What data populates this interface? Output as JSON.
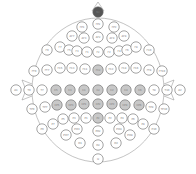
{
  "diagram": {
    "colors": {
      "highlight": "#c8c8c8",
      "reference": "#555555",
      "default": "#ffffff"
    },
    "electrodes": [
      {
        "label": "Nz",
        "x": 98,
        "y": 12,
        "type": "dark"
      },
      {
        "label": "FPz",
        "x": 98,
        "y": 24,
        "type": "normal"
      },
      {
        "label": "FP1",
        "x": 82,
        "y": 27,
        "type": "normal"
      },
      {
        "label": "FP2",
        "x": 114,
        "y": 27,
        "type": "normal"
      },
      {
        "label": "AF7",
        "x": 72,
        "y": 36,
        "type": "normal"
      },
      {
        "label": "AF3",
        "x": 84,
        "y": 38,
        "type": "normal"
      },
      {
        "label": "AFz",
        "x": 98,
        "y": 37,
        "type": "normal"
      },
      {
        "label": "AF4",
        "x": 112,
        "y": 38,
        "type": "normal"
      },
      {
        "label": "AF8",
        "x": 124,
        "y": 36,
        "type": "normal"
      },
      {
        "label": "F9",
        "x": 47,
        "y": 50,
        "type": "normal"
      },
      {
        "label": "F7",
        "x": 60,
        "y": 47,
        "type": "normal"
      },
      {
        "label": "F5",
        "x": 69,
        "y": 50,
        "type": "normal"
      },
      {
        "label": "F3",
        "x": 77,
        "y": 51,
        "type": "normal"
      },
      {
        "label": "F1",
        "x": 87,
        "y": 52,
        "type": "normal"
      },
      {
        "label": "Fz",
        "x": 98,
        "y": 52,
        "type": "normal"
      },
      {
        "label": "F2",
        "x": 109,
        "y": 52,
        "type": "normal"
      },
      {
        "label": "F4",
        "x": 119,
        "y": 51,
        "type": "normal"
      },
      {
        "label": "F6",
        "x": 127,
        "y": 50,
        "type": "normal"
      },
      {
        "label": "F8",
        "x": 136,
        "y": 47,
        "type": "normal"
      },
      {
        "label": "F10",
        "x": 149,
        "y": 50,
        "type": "normal"
      },
      {
        "label": "FT9",
        "x": 34,
        "y": 71,
        "type": "normal"
      },
      {
        "label": "FT7",
        "x": 47,
        "y": 70,
        "type": "normal"
      },
      {
        "label": "FC5",
        "x": 60,
        "y": 68,
        "type": "normal"
      },
      {
        "label": "FC3",
        "x": 72,
        "y": 68,
        "type": "normal"
      },
      {
        "label": "FC1",
        "x": 85,
        "y": 69,
        "type": "normal"
      },
      {
        "label": "FCz",
        "x": 98,
        "y": 70,
        "type": "gray"
      },
      {
        "label": "FC2",
        "x": 111,
        "y": 69,
        "type": "normal"
      },
      {
        "label": "FC4",
        "x": 124,
        "y": 68,
        "type": "normal"
      },
      {
        "label": "FC6",
        "x": 136,
        "y": 68,
        "type": "normal"
      },
      {
        "label": "FT8",
        "x": 149,
        "y": 70,
        "type": "normal"
      },
      {
        "label": "FT10",
        "x": 162,
        "y": 71,
        "type": "normal"
      },
      {
        "label": "A1",
        "x": 16,
        "y": 90,
        "type": "normal"
      },
      {
        "label": "T9",
        "x": 29,
        "y": 90,
        "type": "normal"
      },
      {
        "label": "T7",
        "x": 42,
        "y": 90,
        "type": "normal"
      },
      {
        "label": "C5",
        "x": 56,
        "y": 90,
        "type": "gray"
      },
      {
        "label": "C3",
        "x": 70,
        "y": 90,
        "type": "gray"
      },
      {
        "label": "C1",
        "x": 84,
        "y": 90,
        "type": "gray"
      },
      {
        "label": "Cz",
        "x": 98,
        "y": 90,
        "type": "gray"
      },
      {
        "label": "C2",
        "x": 112,
        "y": 90,
        "type": "gray"
      },
      {
        "label": "C4",
        "x": 126,
        "y": 90,
        "type": "gray"
      },
      {
        "label": "C6",
        "x": 140,
        "y": 90,
        "type": "gray"
      },
      {
        "label": "T8",
        "x": 154,
        "y": 90,
        "type": "normal"
      },
      {
        "label": "T10",
        "x": 167,
        "y": 90,
        "type": "normal"
      },
      {
        "label": "A2",
        "x": 180,
        "y": 90,
        "type": "normal"
      },
      {
        "label": "TP9",
        "x": 32,
        "y": 109,
        "type": "normal"
      },
      {
        "label": "TP7",
        "x": 45,
        "y": 107,
        "type": "normal"
      },
      {
        "label": "CP5",
        "x": 57,
        "y": 105,
        "type": "gray"
      },
      {
        "label": "CP3",
        "x": 71,
        "y": 105,
        "type": "gray"
      },
      {
        "label": "CP1",
        "x": 84,
        "y": 104,
        "type": "gray"
      },
      {
        "label": "CPz",
        "x": 98,
        "y": 104,
        "type": "gray"
      },
      {
        "label": "CP2",
        "x": 112,
        "y": 104,
        "type": "gray"
      },
      {
        "label": "CP4",
        "x": 125,
        "y": 105,
        "type": "gray"
      },
      {
        "label": "CP6",
        "x": 139,
        "y": 105,
        "type": "gray"
      },
      {
        "label": "TP8",
        "x": 151,
        "y": 107,
        "type": "normal"
      },
      {
        "label": "TP10",
        "x": 164,
        "y": 109,
        "type": "normal"
      },
      {
        "label": "P9",
        "x": 42,
        "y": 129,
        "type": "normal"
      },
      {
        "label": "P7",
        "x": 53,
        "y": 124,
        "type": "normal"
      },
      {
        "label": "P5",
        "x": 63,
        "y": 119,
        "type": "normal"
      },
      {
        "label": "P3",
        "x": 74,
        "y": 118,
        "type": "normal"
      },
      {
        "label": "P1",
        "x": 86,
        "y": 118,
        "type": "normal"
      },
      {
        "label": "Pz",
        "x": 98,
        "y": 118,
        "type": "gray"
      },
      {
        "label": "P2",
        "x": 110,
        "y": 118,
        "type": "normal"
      },
      {
        "label": "P4",
        "x": 122,
        "y": 118,
        "type": "normal"
      },
      {
        "label": "P6",
        "x": 133,
        "y": 119,
        "type": "normal"
      },
      {
        "label": "P8",
        "x": 143,
        "y": 124,
        "type": "normal"
      },
      {
        "label": "P10",
        "x": 154,
        "y": 129,
        "type": "normal"
      },
      {
        "label": "PO7",
        "x": 66,
        "y": 135,
        "type": "normal"
      },
      {
        "label": "PO3",
        "x": 77,
        "y": 129,
        "type": "normal"
      },
      {
        "label": "POz",
        "x": 98,
        "y": 131,
        "type": "normal"
      },
      {
        "label": "PO4",
        "x": 119,
        "y": 129,
        "type": "normal"
      },
      {
        "label": "PO8",
        "x": 130,
        "y": 135,
        "type": "normal"
      },
      {
        "label": "O1",
        "x": 80,
        "y": 143,
        "type": "normal"
      },
      {
        "label": "Oz",
        "x": 98,
        "y": 145,
        "type": "normal"
      },
      {
        "label": "O2",
        "x": 116,
        "y": 143,
        "type": "normal"
      },
      {
        "label": "Iz",
        "x": 98,
        "y": 159,
        "type": "normal"
      }
    ]
  }
}
